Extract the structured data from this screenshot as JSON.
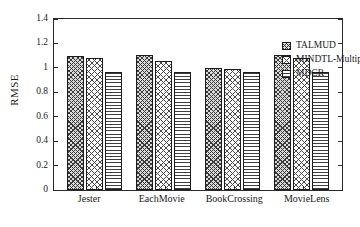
{
  "chart_data": {
    "type": "bar",
    "title": "",
    "xlabel": "",
    "ylabel": "RMSE",
    "categories": [
      "Jester",
      "EachMovie",
      "BookCrossing",
      "MovieLens"
    ],
    "series": [
      {
        "name": "TALMUD",
        "values": [
          1.1,
          1.105,
          1.0,
          1.105
        ]
      },
      {
        "name": "MINDTL-Multiple",
        "values": [
          1.08,
          1.06,
          0.99,
          1.08
        ]
      },
      {
        "name": "MDCR",
        "values": [
          0.97,
          0.97,
          0.97,
          0.97
        ]
      }
    ],
    "ylim": [
      0,
      1.4
    ],
    "ytick_labels": [
      "0",
      "0.2",
      "0.4",
      "0.6",
      "0.8",
      "1",
      "1.2",
      "1.4"
    ],
    "ytick_values": [
      0,
      0.2,
      0.4,
      0.6,
      0.8,
      1.0,
      1.2,
      1.4
    ],
    "grid": false,
    "legend_position": "top-right-inside",
    "legend_entries": [
      {
        "label": "TALMUD",
        "pattern": "diagonal-crosshatch"
      },
      {
        "label": "MINDTL-Multiple",
        "pattern": "diamond-checker"
      },
      {
        "label": "MDCR",
        "pattern": "horizontal-lines"
      }
    ],
    "colors": {
      "axis": "#2a2a2a",
      "bar_outline": "#1c1c1c",
      "background": "#ffffff",
      "text": "#1a1a1a"
    }
  }
}
